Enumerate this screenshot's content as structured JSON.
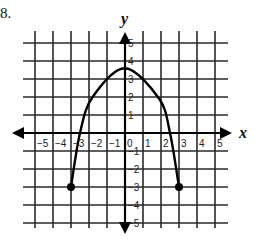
{
  "problem": {
    "number": "8."
  },
  "chart_data": {
    "type": "line",
    "title": "",
    "xlabel": "x",
    "ylabel": "y",
    "xlim": [
      -5,
      5
    ],
    "ylim": [
      -5,
      5
    ],
    "grid": true,
    "x_ticks": [
      "-5",
      "-4",
      "-3",
      "-2",
      "-1",
      "0",
      "1",
      "2",
      "3",
      "4",
      "5"
    ],
    "y_ticks": [
      "-5",
      "-4",
      "-3",
      "-2",
      "-1",
      "1",
      "2",
      "3",
      "4",
      "5"
    ],
    "series": [
      {
        "name": "parabola",
        "shape": "downward-opening parabola",
        "points": [
          {
            "x": -3,
            "y": -3,
            "endpoint": "closed"
          },
          {
            "x": -2.5,
            "y": 0
          },
          {
            "x": -1.8,
            "y": 2
          },
          {
            "x": 0,
            "y": 3.6
          },
          {
            "x": 1.9,
            "y": 1.9
          },
          {
            "x": 2.5,
            "y": 0
          },
          {
            "x": 3,
            "y": -3,
            "endpoint": "closed"
          }
        ]
      }
    ],
    "colors": {
      "curve": "#000000",
      "grid": "#2a2a2a",
      "background": "#ffffff"
    }
  }
}
